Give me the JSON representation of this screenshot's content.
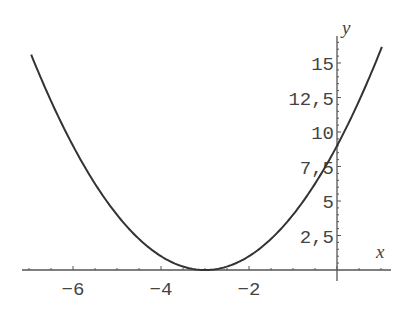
{
  "chart_data": {
    "type": "line",
    "title": "",
    "function": "y = (x + 3)^2",
    "xlabel": "x",
    "ylabel": "y",
    "xlim": [
      -7.1,
      1.25
    ],
    "ylim": [
      0,
      17
    ],
    "x_ticks": [
      -6,
      -4,
      -2
    ],
    "x_tick_labels": [
      "-6",
      "-4",
      "-2"
    ],
    "y_ticks": [
      2.5,
      5,
      7.5,
      10,
      12.5,
      15
    ],
    "y_tick_labels": [
      "2,5",
      "5",
      "7,5",
      "10",
      "12,5",
      "15"
    ],
    "grid": false,
    "legend": null,
    "series": [
      {
        "name": "parabola",
        "x": [
          -6.95,
          -6,
          -5,
          -4,
          -3,
          -2,
          -1,
          0,
          1.02
        ],
        "y": [
          15.6,
          9,
          4,
          1,
          0,
          1,
          4,
          9,
          16.2
        ]
      }
    ],
    "colors": {
      "curve": "#333333",
      "axis": "#555555",
      "text": "#444444"
    }
  },
  "axes": {
    "x_label": "x",
    "y_label": "y"
  }
}
